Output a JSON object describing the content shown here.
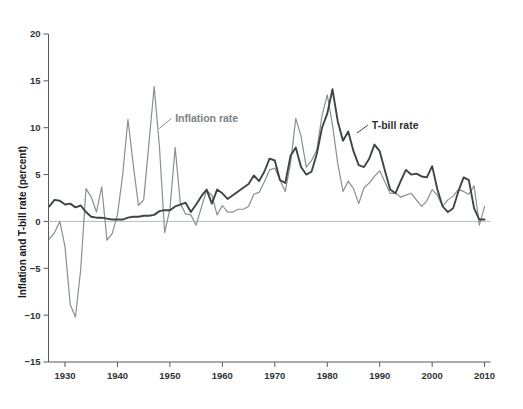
{
  "chart_data": {
    "type": "line",
    "title": "",
    "subtitle": "",
    "xlabel": "",
    "ylabel": "Inflation and T-bill rate (percent)",
    "xlim": [
      1926,
      2011
    ],
    "ylim": [
      -15,
      20
    ],
    "ytick_values": [
      20,
      15,
      10,
      5,
      0,
      -5,
      -10,
      -15
    ],
    "ytick_labels": [
      "20",
      "15",
      "10",
      "5",
      "0",
      "−5",
      "−10",
      "−15"
    ],
    "xtick_values": [
      1930,
      1940,
      1950,
      1960,
      1970,
      1980,
      1990,
      2000,
      2010
    ],
    "xtick_labels": [
      "1930",
      "1940",
      "1950",
      "1960",
      "1970",
      "1980",
      "1990",
      "2000",
      "2010"
    ],
    "grid": false,
    "legend_position": "inline-annotations",
    "zero_reference_line": 0,
    "annotations": [
      {
        "name": "inflation-rate-label",
        "text": "Inflation rate",
        "x": 1951.0,
        "y": 10.6,
        "color": "#7c8184"
      },
      {
        "name": "t-bill-rate-label",
        "text": "T-bill rate",
        "x": 1988.5,
        "y": 9.9,
        "color": "#2b2f32"
      }
    ],
    "series": [
      {
        "name": "Inflation rate",
        "color": "#8a8f92",
        "width": 1.2,
        "x": [
          1927,
          1928,
          1929,
          1930,
          1931,
          1932,
          1933,
          1934,
          1935,
          1936,
          1937,
          1938,
          1939,
          1940,
          1941,
          1942,
          1943,
          1944,
          1945,
          1946,
          1947,
          1948,
          1949,
          1950,
          1951,
          1952,
          1953,
          1954,
          1955,
          1956,
          1957,
          1958,
          1959,
          1960,
          1961,
          1962,
          1963,
          1964,
          1965,
          1966,
          1967,
          1968,
          1969,
          1970,
          1971,
          1972,
          1973,
          1974,
          1975,
          1976,
          1977,
          1978,
          1979,
          1980,
          1981,
          1982,
          1983,
          1984,
          1985,
          1986,
          1987,
          1988,
          1989,
          1990,
          1991,
          1992,
          1993,
          1994,
          1995,
          1996,
          1997,
          1998,
          1999,
          2000,
          2001,
          2002,
          2003,
          2004,
          2005,
          2006,
          2007,
          2008,
          2009,
          2010
        ],
        "values": [
          -1.9,
          -1.2,
          0.0,
          -2.7,
          -8.9,
          -10.2,
          -5.1,
          3.5,
          2.6,
          1.0,
          3.7,
          -2.0,
          -1.3,
          0.7,
          5.0,
          10.9,
          6.1,
          1.7,
          2.3,
          8.3,
          14.4,
          8.0,
          -1.2,
          1.3,
          7.9,
          1.9,
          0.8,
          0.7,
          -0.4,
          1.5,
          3.3,
          2.8,
          0.7,
          1.7,
          1.0,
          1.0,
          1.3,
          1.3,
          1.6,
          2.9,
          3.1,
          4.2,
          5.5,
          5.7,
          4.4,
          3.2,
          6.2,
          11.0,
          9.1,
          5.8,
          6.5,
          7.6,
          11.3,
          13.5,
          10.3,
          6.2,
          3.2,
          4.3,
          3.5,
          1.9,
          3.6,
          4.1,
          4.8,
          5.4,
          4.2,
          3.0,
          3.0,
          2.6,
          2.8,
          3.0,
          2.3,
          1.6,
          2.2,
          3.4,
          2.8,
          1.6,
          2.3,
          2.7,
          3.4,
          3.2,
          2.9,
          3.8,
          -0.4,
          1.6
        ]
      },
      {
        "name": "T-bill rate",
        "color": "#404447",
        "width": 1.9,
        "x": [
          1927,
          1928,
          1929,
          1930,
          1931,
          1932,
          1933,
          1934,
          1935,
          1936,
          1937,
          1938,
          1939,
          1940,
          1941,
          1942,
          1943,
          1944,
          1945,
          1946,
          1947,
          1948,
          1949,
          1950,
          1951,
          1952,
          1953,
          1954,
          1955,
          1956,
          1957,
          1958,
          1959,
          1960,
          1961,
          1962,
          1963,
          1964,
          1965,
          1966,
          1967,
          1968,
          1969,
          1970,
          1971,
          1972,
          1973,
          1974,
          1975,
          1976,
          1977,
          1978,
          1979,
          1980,
          1981,
          1982,
          1983,
          1984,
          1985,
          1986,
          1987,
          1988,
          1989,
          1990,
          1991,
          1992,
          1993,
          1994,
          1995,
          1996,
          1997,
          1998,
          1999,
          2000,
          2001,
          2002,
          2003,
          2004,
          2005,
          2006,
          2007,
          2008,
          2009,
          2010
        ],
        "values": [
          1.6,
          2.3,
          2.2,
          1.8,
          1.9,
          1.5,
          1.7,
          1.0,
          0.5,
          0.4,
          0.4,
          0.3,
          0.2,
          0.2,
          0.2,
          0.4,
          0.5,
          0.5,
          0.6,
          0.6,
          0.7,
          1.1,
          1.2,
          1.2,
          1.6,
          1.8,
          2.0,
          1.0,
          1.8,
          2.7,
          3.4,
          1.9,
          3.4,
          3.0,
          2.4,
          2.8,
          3.2,
          3.6,
          4.0,
          4.9,
          4.3,
          5.3,
          6.7,
          6.5,
          4.4,
          4.1,
          7.0,
          7.9,
          5.8,
          5.0,
          5.3,
          7.2,
          10.0,
          11.5,
          14.1,
          10.7,
          8.6,
          9.6,
          7.5,
          6.0,
          5.8,
          6.7,
          8.2,
          7.5,
          5.4,
          3.4,
          3.0,
          4.3,
          5.5,
          5.0,
          5.1,
          4.8,
          4.7,
          5.9,
          3.4,
          1.6,
          1.0,
          1.4,
          3.2,
          4.7,
          4.4,
          1.4,
          0.2,
          0.2
        ]
      }
    ]
  },
  "axes": {
    "y_axis_title": "Inflation and T-bill rate (percent)"
  }
}
